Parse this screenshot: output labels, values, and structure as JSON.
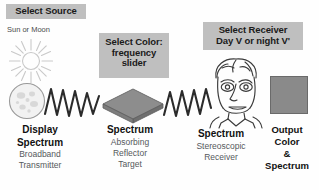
{
  "diagram": {
    "background_color": "#fefefe",
    "tag_background_color": "#bfbfbf",
    "graphic_fill_color": "#808080",
    "graphic_stroke_color": "#555555"
  },
  "tags": {
    "source": {
      "label": "Select Source",
      "lines": [
        "Select Source"
      ]
    },
    "color": {
      "label": "Select Color: frequency slider",
      "lines": [
        "Select Color:",
        "frequency",
        "slider"
      ]
    },
    "receiver": {
      "label": "Select Receiver Day V or night V'",
      "lines": [
        "Select Receiver",
        "Day V or night V'"
      ]
    }
  },
  "notes": {
    "sun_or_moon": "Sun or Moon"
  },
  "captions": {
    "display": {
      "heading_lines": [
        "Display",
        "Spectrum"
      ],
      "sub_lines": [
        "Broadband",
        "Transmitter"
      ]
    },
    "spectrum": {
      "heading_lines": [
        "Spectrum"
      ],
      "sub_lines": [
        "Absorbing",
        "Reflector",
        "Target"
      ]
    },
    "receiver": {
      "heading_lines": [
        "Spectrum"
      ],
      "sub_lines": [
        "Stereoscopic",
        "Receiver"
      ]
    },
    "output": {
      "heading_lines": [
        "Output",
        "Color",
        "&",
        "Spectrum"
      ],
      "sub_lines": []
    }
  },
  "graphics": {
    "sun": "sun-icon",
    "moon": "moon-icon",
    "wave_one": "zigzag-wave-icon",
    "diamond": "reflector-target-icon",
    "wave_two": "zigzag-wave-icon",
    "face": "receiver-face-icon",
    "swatch": "output-color-swatch"
  }
}
